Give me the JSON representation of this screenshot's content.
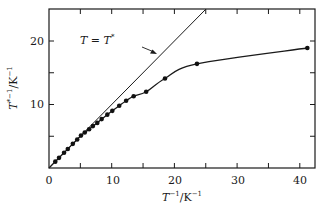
{
  "chart_data": {
    "type": "scatter",
    "title": "",
    "xlabel": "T^{-1}/K^{-1}",
    "ylabel": "T*^{-1}/K^{-1}",
    "xlim": [
      0,
      42
    ],
    "ylim": [
      0,
      25
    ],
    "xticks": [
      0,
      10,
      20,
      30,
      40
    ],
    "yticks": [
      10,
      20
    ],
    "minor_xticks": [
      5,
      15,
      25,
      35
    ],
    "minor_yticks": [
      5,
      15
    ],
    "grid": false,
    "legend": null,
    "series": [
      {
        "name": "measured",
        "style": "points-with-smooth-curve",
        "x": [
          1.0,
          1.6,
          2.4,
          3.0,
          3.8,
          4.5,
          5.1,
          5.7,
          6.4,
          7.0,
          7.7,
          8.4,
          9.3,
          10.1,
          11.2,
          12.3,
          13.5,
          15.5,
          18.5,
          23.6,
          41.2
        ],
        "y": [
          1.0,
          1.6,
          2.4,
          3.0,
          3.8,
          4.5,
          5.1,
          5.6,
          6.1,
          6.6,
          7.1,
          7.7,
          8.4,
          9.0,
          9.8,
          10.6,
          11.3,
          12.0,
          14.1,
          16.4,
          18.9
        ]
      },
      {
        "name": "T = T*",
        "style": "line",
        "x": [
          0,
          25
        ],
        "y": [
          0,
          25
        ]
      }
    ],
    "annotations": [
      {
        "text": "T = T*",
        "points_to": "line T = T*",
        "arrow": true
      }
    ]
  },
  "labels": {
    "xtick_0": "0",
    "xtick_10": "10",
    "xtick_20": "20",
    "xtick_30": "30",
    "xtick_40": "40",
    "ytick_10": "10",
    "ytick_20": "20",
    "annotation_lhs": "T",
    "annotation_eq": " = ",
    "annotation_rhs": "T",
    "annotation_star": "*",
    "xlabel_T": "T",
    "xlabel_exp": "−1",
    "xlabel_unit": "/K",
    "xlabel_unit_exp": "−1",
    "ylabel_T": "T",
    "ylabel_exp": "*−1",
    "ylabel_unit": "/K",
    "ylabel_unit_exp": "−1"
  }
}
